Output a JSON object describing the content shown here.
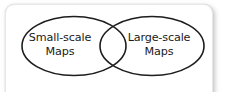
{
  "diagram": {
    "type": "venn",
    "shape": "two-overlapping-ellipses",
    "sets": [
      {
        "id": "small-scale",
        "line1": "Small-scale",
        "line2": "Maps"
      },
      {
        "id": "large-scale",
        "line1": "Large-scale",
        "line2": "Maps"
      }
    ],
    "intersection_label": "",
    "colors": {
      "outline": "#1d1d1d",
      "fill": "#ffffff",
      "text": "#1b1b1b",
      "card_background": "#ffffff",
      "card_border": "#e8e8e8",
      "shadow": "#787878"
    }
  }
}
